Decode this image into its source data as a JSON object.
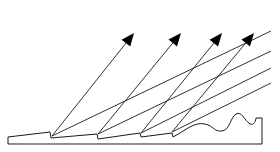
{
  "diagram": {
    "colors": {
      "line": "#1a1a1a",
      "arrowhead": "#000000",
      "background": "#ffffff"
    },
    "surface": {
      "outline": "M8,144 L8,137 L50,132 L51,138 L97,134 L98,139 L140,133 L141,137 L172,133 L173,137 L180,133 C188,128 196,122 205,124 C214,126 214,132 222,131 C230,130 230,118 236,114 C242,111 244,120 250,124 C254,126 256,120 256,118 L262,118 L262,144 Z"
    },
    "arrows": [
      {
        "name": "arrow-1",
        "x1": 52,
        "y1": 136,
        "x2": 134,
        "y2": 33
      },
      {
        "name": "arrow-2",
        "x1": 98,
        "y1": 134,
        "x2": 181,
        "y2": 33
      },
      {
        "name": "arrow-3",
        "x1": 141,
        "y1": 133,
        "x2": 222,
        "y2": 33
      },
      {
        "name": "arrow-4",
        "x1": 172,
        "y1": 132,
        "x2": 254,
        "y2": 33
      }
    ],
    "incident_lines": [
      {
        "name": "incident-line-1",
        "x1": 52,
        "y1": 136,
        "x2": 271,
        "y2": 31
      },
      {
        "name": "incident-line-2",
        "x1": 98,
        "y1": 134,
        "x2": 271,
        "y2": 51
      },
      {
        "name": "incident-line-3",
        "x1": 141,
        "y1": 133,
        "x2": 271,
        "y2": 68
      },
      {
        "name": "incident-line-4",
        "x1": 172,
        "y1": 132,
        "x2": 271,
        "y2": 83
      }
    ]
  }
}
